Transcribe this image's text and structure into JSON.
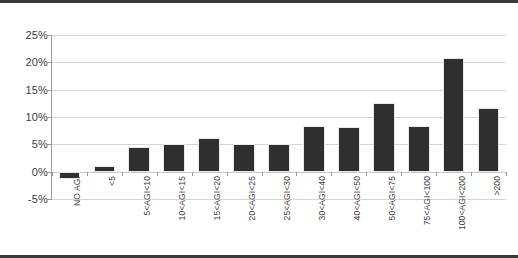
{
  "chart_data": {
    "type": "bar",
    "title": "",
    "subtitle": "",
    "xlabel": "",
    "ylabel": "",
    "ylim": [
      -5,
      25
    ],
    "yticks": [
      "-5%",
      "0%",
      "5%",
      "10%",
      "15%",
      "20%",
      "25%"
    ],
    "ytick_values": [
      -5,
      0,
      5,
      10,
      15,
      20,
      25
    ],
    "grid": "horizontal",
    "legend": "none",
    "bar_color": "#2f2f2f",
    "gridline_color": "#d4d4d4",
    "axis_color": "#9a9a9a",
    "categories": [
      "NO AGI",
      "<5",
      "5<AGI<10",
      "10<AGI<15",
      "15<AGI<20",
      "20<AGI<25",
      "25<AGI<30",
      "30<AGI<40",
      "40<AGI<50",
      "50<AGI<75",
      "75<AGI<100",
      "100<AGI<200",
      ">200"
    ],
    "values": [
      -1.3,
      1.1,
      4.6,
      5.0,
      6.1,
      5.1,
      5.1,
      8.4,
      8.2,
      12.6,
      8.3,
      20.8,
      11.6
    ],
    "value_unit": "%"
  }
}
